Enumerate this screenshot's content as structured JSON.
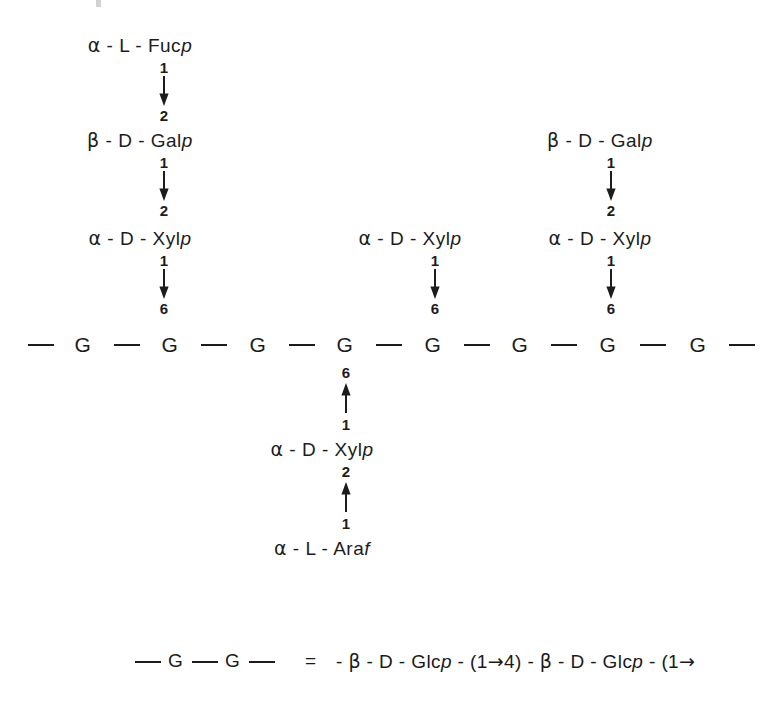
{
  "figure": {
    "type": "polysaccharide-structure-diagram",
    "backbone": {
      "unit_label": "G",
      "count": 8,
      "leading_dash": true,
      "trailing_dash": true
    },
    "residues": {
      "fucose": "α - L - Fuc",
      "galactose": "β - D - Gal",
      "xylose": "α - D - Xyl",
      "arabinose": "α - L - Ara",
      "ring_p": "p",
      "ring_f": "f"
    },
    "digits": {
      "one": "1",
      "two": "2",
      "six": "6"
    },
    "branches": [
      {
        "name": "left-branch",
        "anchor_backbone_index": 1,
        "chain": [
          {
            "residue": "α - L - Fuc",
            "ring": "p",
            "donor": "1",
            "acceptor": "2"
          },
          {
            "residue": "β - D - Gal",
            "ring": "p",
            "donor": "1",
            "acceptor": "2"
          },
          {
            "residue": "α - D - Xyl",
            "ring": "p",
            "donor": "1",
            "acceptor": "6"
          }
        ],
        "direction": "down"
      },
      {
        "name": "middle-branch",
        "anchor_backbone_index": 5,
        "chain": [
          {
            "residue": "α - D - Xyl",
            "ring": "p",
            "donor": "1",
            "acceptor": "6"
          }
        ],
        "direction": "down"
      },
      {
        "name": "right-branch",
        "anchor_backbone_index": 7,
        "chain": [
          {
            "residue": "β - D - Gal",
            "ring": "p",
            "donor": "1",
            "acceptor": "2"
          },
          {
            "residue": "α - D - Xyl",
            "ring": "p",
            "donor": "1",
            "acceptor": "6"
          }
        ],
        "direction": "down"
      },
      {
        "name": "lower-branch",
        "anchor_backbone_index": 4,
        "chain": [
          {
            "residue": "α - D - Xyl",
            "ring": "p",
            "donor": "1",
            "acceptor": "6"
          },
          {
            "residue": "α - L - Ara",
            "ring": "f",
            "donor": "1",
            "acceptor": "2"
          }
        ],
        "direction": "up"
      }
    ]
  },
  "legend": {
    "motif": "— G — G —",
    "equals": "=",
    "expansion_part1": "- β - D - Glc",
    "expansion_ring1": "p",
    "expansion_part2": "- (1",
    "expansion_part3": "4) - β - D - Glc",
    "expansion_ring2": "p",
    "expansion_part4": "- (1",
    "arrow_glyph": "→"
  },
  "colors": {
    "ink": "#1c1c1c",
    "background": "#ffffff"
  }
}
